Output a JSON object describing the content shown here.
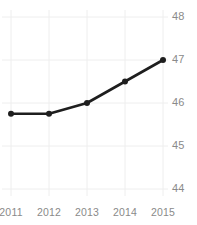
{
  "chart_data": {
    "type": "line",
    "title": "",
    "subtitle": "",
    "xlabel": "",
    "ylabel": "",
    "categories": [
      "2011",
      "2012",
      "2013",
      "2014",
      "2015"
    ],
    "x": [
      2011,
      2012,
      2013,
      2014,
      2015
    ],
    "values": [
      45.75,
      45.75,
      46.0,
      46.5,
      47.0
    ],
    "series": [
      {
        "name": "",
        "values": [
          45.75,
          45.75,
          46.0,
          46.5,
          47.0
        ]
      }
    ],
    "xlim": [
      2011,
      2015
    ],
    "ylim": [
      44,
      48
    ],
    "yticks": [
      44,
      45,
      46,
      47,
      48
    ],
    "ytick_labels": [
      "44",
      "45",
      "46",
      "47",
      "48"
    ],
    "xticks": [
      2011,
      2012,
      2013,
      2014,
      2015
    ],
    "xtick_labels": [
      "2011",
      "2012",
      "2013",
      "2014",
      "2015"
    ],
    "grid": true,
    "grid_axis": "both",
    "legend": false,
    "legend_position": "none",
    "markers": true,
    "marker_shape": "circle",
    "annotations": []
  },
  "style": {
    "line_color": "#1e1e1e",
    "marker_color": "#1e1e1e",
    "grid_color": "#eeeeee",
    "tick_label_color": "#8a8a8a",
    "background_color": "#ffffff",
    "line_width": 2.6,
    "marker_radius": 3.0
  },
  "axis_geometry": {
    "x_pixels": [
      11,
      49,
      87,
      125,
      163
    ],
    "y_pixels_for_ticks": [
      189,
      146,
      103,
      60,
      17
    ],
    "ytick_label_x": 172,
    "xtick_label_y": 206
  }
}
